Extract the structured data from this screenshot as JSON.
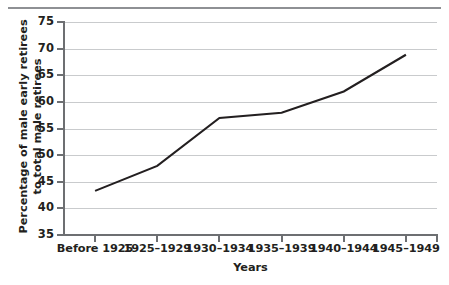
{
  "chart_data": {
    "type": "line",
    "title": "",
    "xlabel": "Years",
    "ylabel": "Percentage of male early retirees to total male retirees",
    "ylabel_line1": "Percentage of male early retirees",
    "ylabel_line2": "to total male retirees",
    "categories": [
      "Before 1925",
      "1925–1929",
      "1930–1934",
      "1935–1939",
      "1940–1944",
      "1945–1949"
    ],
    "values": [
      43.3,
      48.0,
      57.0,
      58.0,
      62.0,
      68.9
    ],
    "series": [
      {
        "name": "Percentage of male early retirees to total male retirees",
        "values": [
          43.3,
          48.0,
          57.0,
          58.0,
          62.0,
          68.9
        ]
      }
    ],
    "ylim": [
      35,
      75
    ],
    "yticks": [
      75,
      70,
      65,
      60,
      55,
      50,
      45,
      40,
      35
    ],
    "ytick_labels": [
      "75",
      "70",
      "65",
      "60",
      "55",
      "50",
      "45",
      "40",
      "35"
    ],
    "grid": true,
    "grid_axis": "y",
    "legend": false,
    "legend_position": "none",
    "line_color": "#231f20",
    "grid_color": "#c9cbcd",
    "axis_color": "#6d6f72",
    "background_color": "#ffffff"
  }
}
